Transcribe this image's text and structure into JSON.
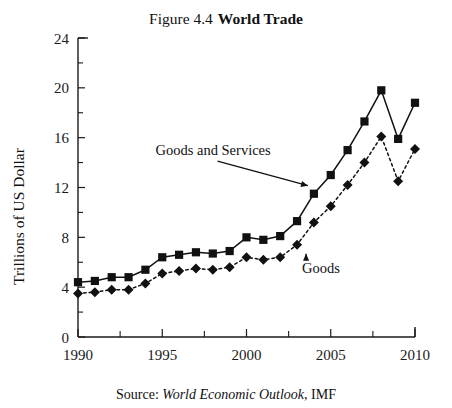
{
  "title": {
    "figure_number": "Figure 4.4",
    "figure_name": "World Trade"
  },
  "source": {
    "prefix": "Source:",
    "publication": "World Economic Outlook",
    "suffix": ", IMF"
  },
  "chart_data": {
    "type": "line",
    "xlabel": "",
    "ylabel": "Trillions of US Dollar",
    "xlim": [
      1990,
      2010
    ],
    "ylim": [
      0,
      24
    ],
    "ytick_labels": [
      "0",
      "4",
      "8",
      "12",
      "16",
      "20",
      "24"
    ],
    "ytick_values": [
      0,
      4,
      8,
      12,
      16,
      20,
      24
    ],
    "yminor_step": 2,
    "xtick_labels": [
      "1990",
      "1995",
      "2000",
      "2005",
      "2010"
    ],
    "xtick_values": [
      1990,
      1995,
      2000,
      2005,
      2010
    ],
    "xminor_step": 2.5,
    "grid": false,
    "legend_position": "inline-annotations",
    "x": [
      1990,
      1991,
      1992,
      1993,
      1994,
      1995,
      1996,
      1997,
      1998,
      1999,
      2000,
      2001,
      2002,
      2003,
      2004,
      2005,
      2006,
      2007,
      2008,
      2009,
      2010
    ],
    "series": [
      {
        "name": "Goods and Services",
        "marker": "square",
        "line_style": "solid",
        "color": "#111111",
        "values": [
          4.4,
          4.5,
          4.8,
          4.8,
          5.4,
          6.4,
          6.6,
          6.8,
          6.7,
          6.9,
          8.0,
          7.8,
          8.1,
          9.3,
          11.5,
          13.0,
          15.0,
          17.3,
          19.8,
          15.9,
          18.8
        ]
      },
      {
        "name": "Goods",
        "marker": "diamond",
        "line_style": "dotted",
        "color": "#111111",
        "values": [
          3.5,
          3.6,
          3.8,
          3.8,
          4.3,
          5.1,
          5.3,
          5.5,
          5.4,
          5.6,
          6.4,
          6.2,
          6.4,
          7.4,
          9.2,
          10.5,
          12.2,
          14.0,
          16.1,
          12.5,
          15.1
        ]
      }
    ],
    "annotations": [
      {
        "text": "Goods and Services",
        "label_x": 1994.6,
        "label_y": 14.6,
        "target_x": 2004,
        "target_y": 11.5
      },
      {
        "text": "Goods",
        "label_x": 2003.3,
        "label_y": 5.1,
        "target_x": 2003,
        "target_y": 7.4
      }
    ]
  }
}
